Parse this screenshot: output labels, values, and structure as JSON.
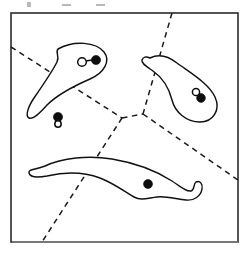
{
  "figure": {
    "canvas": {
      "width": 248,
      "height": 254
    },
    "ink_color": "#111111",
    "background_color": "#ffffff",
    "dash_color": "#1a1a1a",
    "frame": {
      "label": "bounding-box",
      "x": 11,
      "y": 13,
      "width": 227,
      "height": 229,
      "stroke_color": "#2b2b2b"
    },
    "partition": {
      "style": "dashed",
      "vertices": [
        {
          "name": "junction-left",
          "x": 122,
          "y": 118
        },
        {
          "name": "junction-right",
          "x": 143,
          "y": 114
        }
      ],
      "edges": [
        {
          "name": "edge-upper-left",
          "from": [
            11,
            47
          ],
          "to": [
            122,
            118
          ]
        },
        {
          "name": "edge-junction",
          "from": [
            122,
            118
          ],
          "to": [
            143,
            114
          ]
        },
        {
          "name": "edge-upper-right",
          "from": [
            172,
            13
          ],
          "to": [
            143,
            114
          ]
        },
        {
          "name": "edge-lower-right",
          "from": [
            143,
            114
          ],
          "to": [
            238,
            180
          ]
        },
        {
          "name": "edge-lower-left",
          "from": [
            122,
            118
          ],
          "to": [
            42,
            242
          ]
        }
      ]
    },
    "organisms": [
      {
        "name": "organism-upper-left",
        "description": "crescent body tapering to a narrow hooked tail at lower left",
        "nuclei": [
          {
            "type": "open",
            "cx": 82,
            "cy": 62,
            "r": 4.3
          },
          {
            "type": "filled",
            "cx": 96,
            "cy": 60,
            "r": 4.6
          }
        ],
        "nucleus_link": {
          "from": [
            86,
            61
          ],
          "to": [
            92,
            60
          ]
        }
      },
      {
        "name": "organism-right",
        "description": "comma shaped body with blunt rounded snout at upper left",
        "nuclei": [
          {
            "type": "open",
            "cx": 196,
            "cy": 92,
            "r": 3.6
          },
          {
            "type": "filled",
            "cx": 201,
            "cy": 98,
            "r": 4.4
          }
        ]
      },
      {
        "name": "organism-bottom",
        "description": "long slender body with an S-curve hooked tail at the right end",
        "nuclei": [
          {
            "type": "filled",
            "cx": 148,
            "cy": 184,
            "r": 4.5
          }
        ]
      }
    ],
    "free_nuclei": {
      "name": "free-nucleus-pair",
      "description": "unattached nucleus pair in the lower left region",
      "nuclei": [
        {
          "type": "filled",
          "cx": 58,
          "cy": 117,
          "r": 4.6
        },
        {
          "type": "open",
          "cx": 58,
          "cy": 124,
          "r": 3.2
        }
      ]
    },
    "scan_artifacts": {
      "description": "faint gray remnants of a text line cropped above the frame",
      "marks": [
        {
          "x": 27,
          "y": 2,
          "width": 4,
          "height": 5
        },
        {
          "x": 62,
          "y": 4,
          "width": 9,
          "height": 2
        },
        {
          "x": 96,
          "y": 4,
          "width": 9,
          "height": 2
        }
      ]
    }
  }
}
